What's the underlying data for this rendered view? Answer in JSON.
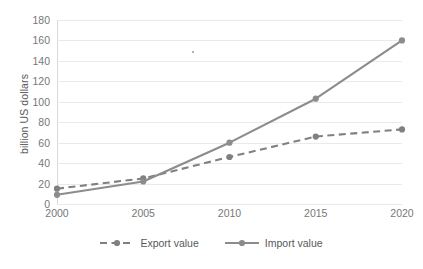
{
  "chart_data": {
    "type": "line",
    "title": "",
    "xlabel": "",
    "ylabel": "billion US dollars",
    "categories": [
      "2000",
      "2005",
      "2010",
      "2015",
      "2020"
    ],
    "series": [
      {
        "name": "Export value",
        "values": [
          15,
          25,
          46,
          66,
          73
        ],
        "style": "dashed",
        "color": "#808080",
        "marker": "circle"
      },
      {
        "name": "Import value",
        "values": [
          9,
          22,
          60,
          103,
          160
        ],
        "style": "solid",
        "color": "#8c8c8c",
        "marker": "circle"
      }
    ],
    "ylim": [
      0,
      180
    ],
    "ytick_step": 20,
    "yticks": [
      "0",
      "20",
      "40",
      "60",
      "80",
      "100",
      "120",
      "140",
      "160",
      "180"
    ],
    "grid": true,
    "grid_axis": "y",
    "legend_position": "bottom"
  },
  "axes": {
    "y_title": "billion US dollars"
  },
  "legend": {
    "items": [
      {
        "label": "Export value"
      },
      {
        "label": "Import value"
      }
    ]
  },
  "colors": {
    "gridline": "#eaeaea",
    "tick_label": "#777777",
    "axis_title": "#595959",
    "export_line": "#808080",
    "import_line": "#8c8c8c",
    "background": "#ffffff"
  }
}
